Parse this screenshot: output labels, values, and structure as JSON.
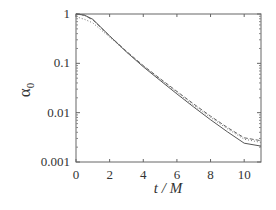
{
  "chart_data": {
    "type": "line",
    "title": "",
    "xlabel": "t / M",
    "ylabel": "α0",
    "ylabel_main": "α",
    "ylabel_sub": "0",
    "xlim": [
      0,
      11
    ],
    "ylim": [
      0.001,
      1
    ],
    "yscale": "log",
    "grid": false,
    "legend": null,
    "xticks": [
      0,
      2,
      4,
      6,
      8,
      10
    ],
    "xtick_labels": [
      "0",
      "2",
      "4",
      "6",
      "8",
      "10"
    ],
    "yticks": [
      1,
      0.1,
      0.01,
      0.001
    ],
    "ytick_labels": [
      "1",
      "0.1",
      "0.01",
      "0.001"
    ],
    "x": [
      0,
      0.5,
      1,
      2,
      3,
      4,
      5,
      6,
      7,
      8,
      9,
      10,
      11
    ],
    "series": [
      {
        "name": "solid",
        "style": "solid",
        "color": "#555555",
        "values": [
          1.0,
          0.95,
          0.78,
          0.36,
          0.17,
          0.085,
          0.045,
          0.024,
          0.013,
          0.0072,
          0.0041,
          0.0024,
          0.0021
        ]
      },
      {
        "name": "dashed",
        "style": "dashed",
        "color": "#666666",
        "values": [
          1.0,
          0.94,
          0.76,
          0.36,
          0.175,
          0.09,
          0.049,
          0.027,
          0.015,
          0.0085,
          0.005,
          0.0031,
          0.0027
        ]
      },
      {
        "name": "dotted",
        "style": "dotted",
        "color": "#777777",
        "values": [
          0.88,
          0.78,
          0.66,
          0.34,
          0.17,
          0.088,
          0.047,
          0.026,
          0.014,
          0.008,
          0.0047,
          0.0029,
          0.0025
        ]
      }
    ]
  }
}
